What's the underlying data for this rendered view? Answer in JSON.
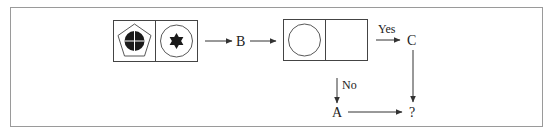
{
  "diagram": {
    "box1": {
      "left_cell": {
        "shape": "pentagon",
        "inner": "filled-circle-with-cross"
      },
      "right_cell": {
        "shape": "circle",
        "inner": "filled-six-pointed-star"
      }
    },
    "node_b": "B",
    "box2": {
      "left_cell": {
        "shape": "circle",
        "inner": "empty"
      },
      "right_cell": {
        "shape": "empty"
      }
    },
    "yes_label": "Yes",
    "node_c": "C",
    "no_label": "No",
    "node_a": "A",
    "node_result": "?",
    "colors": {
      "stroke": "#333333",
      "fill": "#1a1a1a",
      "frame": "#9a9a9a"
    }
  }
}
